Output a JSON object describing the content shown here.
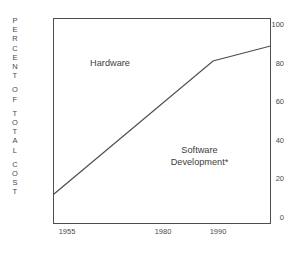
{
  "chart_data": {
    "type": "line",
    "title": "",
    "subtitle": "",
    "xlabel": "",
    "ylabel": "PERCENT OF TOTAL COST",
    "ylabel_letters": [
      "P",
      "E",
      "R",
      "C",
      "E",
      "N",
      "T",
      "",
      "O",
      "F",
      "",
      "T",
      "O",
      "T",
      "A",
      "L",
      "",
      "C",
      "O",
      "S",
      "T"
    ],
    "xlim": [
      1953,
      1998
    ],
    "ylim": [
      0,
      105
    ],
    "y_ticks": [
      0,
      20,
      40,
      60,
      80,
      100
    ],
    "y_tick_labels": [
      "0",
      "20",
      "40",
      "60",
      "80",
      "100"
    ],
    "x_ticks": [
      1955,
      1980,
      1990
    ],
    "x_tick_labels": [
      "1955",
      "1980",
      "1990"
    ],
    "grid": false,
    "legend": "none",
    "series": [
      {
        "name": "Software Development share of total cost",
        "x": [
          1953,
          1990,
          1998
        ],
        "values": [
          14,
          82,
          89
        ],
        "color": "#4f4f4f"
      }
    ],
    "annotations": [
      {
        "text": "Hardware",
        "x": 1965,
        "y": 88,
        "region": "above-curve"
      },
      {
        "text": "Software\nDevelopment*",
        "x": 1983,
        "y": 35,
        "region": "below-curve"
      }
    ],
    "footnote_marker": "*"
  },
  "axes": {
    "y_title": "PERCENT OF TOTAL COST",
    "y_ticks": [
      {
        "label": "100",
        "value": 100
      },
      {
        "label": "80",
        "value": 80
      },
      {
        "label": "60",
        "value": 60
      },
      {
        "label": "40",
        "value": 40
      },
      {
        "label": "20",
        "value": 20
      },
      {
        "label": "0",
        "value": 0
      }
    ],
    "x_ticks": [
      {
        "label": "1955",
        "value": 1955
      },
      {
        "label": "1980",
        "value": 1980
      },
      {
        "label": "1990",
        "value": 1990
      }
    ]
  },
  "labels": {
    "hardware": "Hardware",
    "software_line1": "Software",
    "software_line2": "Development*"
  },
  "colors": {
    "background": "#ffffff",
    "frame": "#4f4f4f",
    "line": "#4f4f4f",
    "text": "#4a4a4a"
  }
}
